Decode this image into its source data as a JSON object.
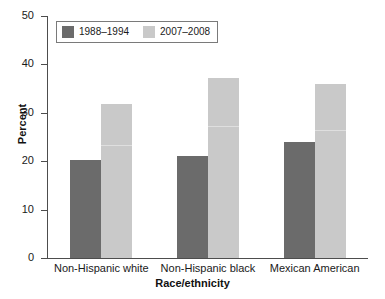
{
  "chart_data": {
    "type": "bar",
    "title": "",
    "subtitle": "",
    "xlabel": "Race/ethnicity",
    "ylabel": "Percent",
    "categories": [
      "Non-Hispanic white",
      "Non-Hispanic black",
      "Mexican American"
    ],
    "series": [
      {
        "name": "1988–1994",
        "color": "#6b6b6b",
        "values": [
          20.3,
          21.1,
          23.9
        ]
      },
      {
        "name": "2007–2008",
        "color": "#c9c9c9",
        "values": [
          31.8,
          37.2,
          35.9
        ]
      }
    ],
    "ylim": [
      0,
      50
    ],
    "yticks": [
      0,
      10,
      20,
      30,
      40,
      50
    ],
    "ytick_labels": [
      "0",
      "10",
      "20",
      "30",
      "40",
      "50"
    ],
    "grid": false,
    "legend_position": "top-left",
    "bar_grouping": "grouped-adjacent"
  },
  "axes": {
    "y_title": "Percent",
    "x_title": "Race/ethnicity"
  },
  "legend": {
    "entries": [
      {
        "label": "1988–1994",
        "color": "#6b6b6b"
      },
      {
        "label": "2007–2008",
        "color": "#c9c9c9"
      }
    ]
  },
  "colors": {
    "series_1": "#6b6b6b",
    "series_2": "#c9c9c9",
    "axis": "#4d4d4d",
    "text": "#1a1a1a",
    "background": "#ffffff"
  }
}
